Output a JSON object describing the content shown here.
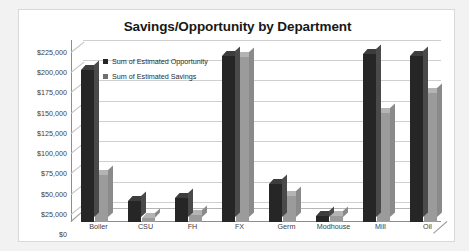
{
  "chart_data": {
    "type": "bar",
    "title": "Savings/Opportunity by Department",
    "xlabel": "",
    "ylabel": "",
    "ylim": [
      0,
      225000
    ],
    "ytick_labels": [
      "$225,000",
      "$200,000",
      "$175,000",
      "$150,000",
      "$125,000",
      "$100,000",
      "$75,000",
      "$50,000",
      "$25,000",
      "$0"
    ],
    "ytick_values": [
      225000,
      200000,
      175000,
      150000,
      125000,
      100000,
      75000,
      50000,
      25000,
      0
    ],
    "grid": true,
    "legend_position": "top-left-inside",
    "categories": [
      "Boiler",
      "CSU",
      "FH",
      "FX",
      "Germ",
      "Modhouse",
      "Mill",
      "Oil"
    ],
    "series": [
      {
        "name": "Sum of Estimated Opportunity",
        "color": "#262626",
        "values": [
          188000,
          26000,
          30000,
          205000,
          47000,
          8000,
          208000,
          205000
        ]
      },
      {
        "name": "Sum of Estimated Savings",
        "color": "#9b9b9b",
        "values": [
          58000,
          5000,
          9000,
          204000,
          32000,
          8000,
          135000,
          160000
        ]
      }
    ]
  },
  "legend": {
    "items": [
      {
        "label": "Sum of Estimated Opportunity"
      },
      {
        "label": "Sum of Estimated Savings"
      }
    ]
  }
}
